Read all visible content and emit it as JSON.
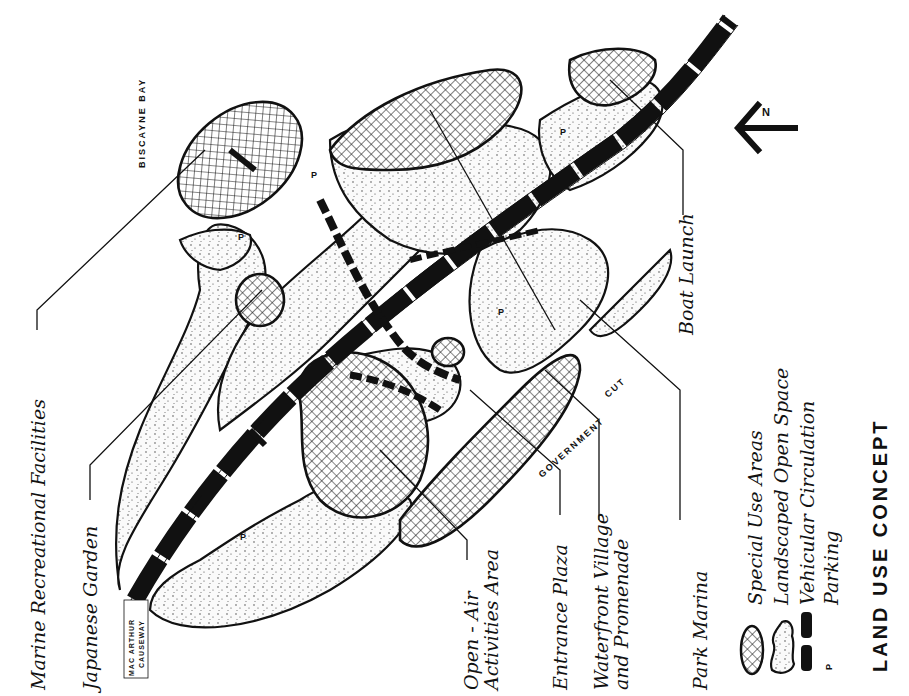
{
  "title": "LAND USE CONCEPT",
  "water_labels": {
    "bay": "BISCAYNE BAY",
    "cut_1": "GOVERNMENT",
    "cut_2": "CUT",
    "causeway_1": "MAC ARTHUR",
    "causeway_2": "CAUSEWAY"
  },
  "north_arrow": {
    "label": "N",
    "icon": "north-arrow-icon"
  },
  "parking_marker": "P",
  "callouts": [
    {
      "id": "marine",
      "label": "Marine Recreational Facilities"
    },
    {
      "id": "japanese",
      "label": "Japanese Garden"
    },
    {
      "id": "openair_1",
      "label": "Open - Air"
    },
    {
      "id": "openair_2",
      "label": "Activities Area"
    },
    {
      "id": "entrance",
      "label": "Entrance Plaza"
    },
    {
      "id": "waterfront_1",
      "label": "Waterfront Village"
    },
    {
      "id": "waterfront_2",
      "label": "and Promenade"
    },
    {
      "id": "marina",
      "label": "Park Marina"
    },
    {
      "id": "boat",
      "label": "Boat Launch"
    }
  ],
  "legend": [
    {
      "symbol": "crosshatch-ellipse",
      "label": "Special Use Areas"
    },
    {
      "symbol": "stippled-cloud",
      "label": "Landscaped Open Space"
    },
    {
      "symbol": "black-dashes",
      "label": "Vehicular Circulation"
    },
    {
      "symbol": "P",
      "label": "Parking"
    }
  ],
  "colors": {
    "ink": "#111111",
    "paper": "#ffffff",
    "stipple": "#f4f4f4"
  }
}
